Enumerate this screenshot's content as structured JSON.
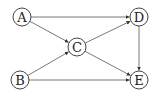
{
  "diagram": {
    "type": "directed-graph",
    "nodes": [
      {
        "id": "A",
        "label": "A",
        "x": 22,
        "y": 17
      },
      {
        "id": "B",
        "label": "B",
        "x": 20,
        "y": 80
      },
      {
        "id": "C",
        "label": "C",
        "x": 77,
        "y": 47
      },
      {
        "id": "D",
        "label": "D",
        "x": 139,
        "y": 17
      },
      {
        "id": "E",
        "label": "E",
        "x": 139,
        "y": 80
      }
    ],
    "edges": [
      {
        "from": "A",
        "to": "D"
      },
      {
        "from": "A",
        "to": "C"
      },
      {
        "from": "B",
        "to": "C"
      },
      {
        "from": "B",
        "to": "E"
      },
      {
        "from": "C",
        "to": "D"
      },
      {
        "from": "C",
        "to": "E"
      },
      {
        "from": "D",
        "to": "E"
      }
    ],
    "node_radius": 9,
    "colors": {
      "stroke": "#444444",
      "edge": "#555555",
      "text": "#222222"
    }
  }
}
